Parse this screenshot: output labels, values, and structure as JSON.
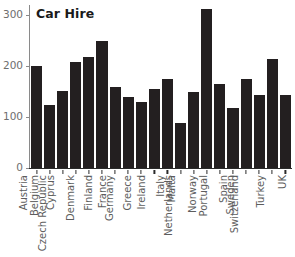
{
  "chart_data": {
    "type": "bar",
    "title": "Car Hire",
    "xlabel": "",
    "ylabel": "",
    "ylim": [
      0,
      320
    ],
    "yticks": [
      0,
      100,
      200,
      300
    ],
    "ytick_labels": [
      "0",
      "100",
      "200",
      "300"
    ],
    "grid": false,
    "legend": null,
    "bar_color": "#231f20",
    "axis_color": "#8a8a8a",
    "tick_label_color": "#6e6e6e",
    "categories": [
      "Austria",
      "Belgium",
      "Cyprus",
      "Czech Republic",
      "Denmark",
      "Finland",
      "France",
      "Germany",
      "Greece",
      "Ireland",
      "Italy",
      "Malta",
      "Netherlands",
      "Norway",
      "Portugal",
      "Spain",
      "Sweden",
      "Switzerland",
      "Turkey",
      "UK"
    ],
    "values": [
      200,
      124,
      151,
      209,
      218,
      250,
      160,
      140,
      129,
      155,
      174,
      89,
      150,
      312,
      164,
      118,
      175,
      144,
      214,
      144
    ]
  }
}
